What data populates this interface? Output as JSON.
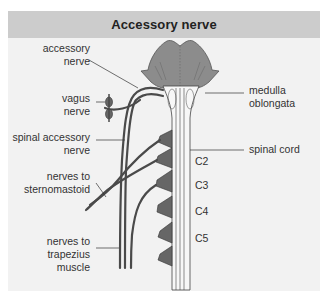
{
  "header": {
    "title": "Accessory nerve"
  },
  "labels": {
    "accessory_nerve": [
      "accessory",
      "nerve"
    ],
    "vagus_nerve": [
      "vagus",
      "nerve"
    ],
    "spinal_accessory_nerve": [
      "spinal accessory",
      "nerve"
    ],
    "nerves_to_sternomastoid": [
      "nerves to",
      "sternomastoid"
    ],
    "nerves_to_trapezius": [
      "nerves to",
      "trapezius",
      "muscle"
    ],
    "medulla_oblongata": [
      "medulla",
      "oblongata"
    ],
    "spinal_cord": "spinal cord",
    "segments": [
      "C2",
      "C3",
      "C4",
      "C5"
    ]
  },
  "colors": {
    "header_bg": "#cccccc",
    "panel_bg": "#f2f2f2",
    "brainstem": "#8c8c8c",
    "nerve": "#4a4a4a",
    "leader": "#333333"
  }
}
